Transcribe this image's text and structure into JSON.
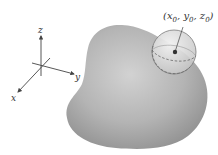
{
  "figure": {
    "point_label": "(x₀, y₀, z₀)",
    "point_label_parts": {
      "open": "(",
      "x": "x",
      "x_sub": "0",
      "y": "y",
      "y_sub": "0",
      "z": "z",
      "z_sub": "0",
      "sep": ", ",
      "close": ")"
    },
    "axes": {
      "x_label": "x",
      "y_label": "y",
      "z_label": "z"
    }
  },
  "colors": {
    "background": "#ffffff",
    "solid_light": "#c8c8c8",
    "solid_dark": "#8a8a8a",
    "sphere_fill": "#e6e6e6",
    "axis": "#444444",
    "dashed": "#6b6b6b",
    "point": "#333333"
  }
}
